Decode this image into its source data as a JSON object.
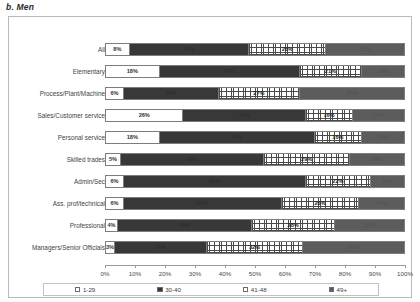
{
  "caption": "b. Men",
  "chart_data": {
    "type": "bar",
    "subtype": "horizontal-100%-stacked",
    "title": "b. Men",
    "xlabel": "",
    "ylabel": "",
    "xlim": [
      0,
      100
    ],
    "grid": false,
    "legend_position": "bottom",
    "categories": [
      "All",
      "Elementary",
      "Process/Plant/Machine",
      "Sales/Customer service",
      "Personal service",
      "Skilled trades",
      "Admin/Sec",
      "Ass. prof/technical",
      "Professional",
      "Managers/Senior Officials"
    ],
    "series": [
      {
        "name": "1-29",
        "values": [
          8,
          18,
          6,
          26,
          18,
          5,
          6,
          6,
          4,
          3
        ]
      },
      {
        "name": "30-40",
        "values": [
          40,
          47,
          32,
          41,
          52,
          48,
          61,
          53,
          45,
          31
        ]
      },
      {
        "name": "41-48",
        "values": [
          26,
          21,
          27,
          16,
          16,
          29,
          22,
          26,
          28,
          32
        ]
      },
      {
        "name": "49+",
        "values": [
          26,
          14,
          35,
          17,
          14,
          18,
          11,
          15,
          23,
          34
        ]
      }
    ],
    "value_labels": {
      "1-29": [
        "8%",
        "18%",
        "6%",
        "26%",
        "18%",
        "5%",
        "6%",
        "6%",
        "4%",
        "3%"
      ],
      "30-40": [
        "40%",
        "47%",
        "32%",
        "41%",
        "52%",
        "48%",
        "61%",
        "53%",
        "45%",
        "31%"
      ],
      "41-48": [
        "26%",
        "21%",
        "27%",
        "16%",
        "16%",
        "29%",
        "22%",
        "26%",
        "28%",
        "32%"
      ],
      "49+": [
        "26%",
        "14%",
        "35%",
        "17%",
        "14%",
        "18%",
        "11%",
        "15%",
        "23%",
        "34%"
      ]
    },
    "xticks": [
      0,
      10,
      20,
      30,
      40,
      50,
      60,
      70,
      80,
      90,
      100
    ],
    "xtick_labels": [
      "0%",
      "10%",
      "20%",
      "30%",
      "40%",
      "50%",
      "60%",
      "70%",
      "80%",
      "90%",
      "100%"
    ],
    "legend": [
      {
        "label": "1-29",
        "swatch": "white",
        "color": "#ffffff"
      },
      {
        "label": "30-40",
        "swatch": "dark",
        "color": "#383838"
      },
      {
        "label": "41-48",
        "swatch": "hatched",
        "color": "#4a4a4a"
      },
      {
        "label": "49+",
        "swatch": "gray",
        "color": "#5c5c5c"
      }
    ]
  }
}
